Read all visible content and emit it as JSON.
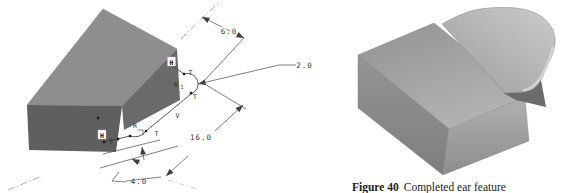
{
  "left_view": {
    "dims": {
      "width": "6.0",
      "radius": "2.0",
      "length": "16.0",
      "offset": "4.0"
    },
    "labels": {
      "h_upper": "H",
      "t_upper_1": "T",
      "r1_main": "R",
      "r1_sub": "1",
      "t_upper_2": "T",
      "v": "V",
      "h_lower": "H",
      "t_lower_1": "T",
      "r_lower": "R",
      "t_lower_2": "T"
    }
  },
  "caption": {
    "label": "Figure 40",
    "text": "Completed ear feature"
  },
  "colors": {
    "block_top": "#8e8e8e",
    "block_left": "#5f5f5f",
    "block_right": "#6a6a6a",
    "rtop_a": "#929292",
    "rtop_b": "#b3b3b3",
    "rleft_a": "#949494",
    "rleft_b": "#7e7e7e",
    "rright_a": "#b0b0b0",
    "rright_b": "#8d8d8d",
    "tab_a": "#9c9c9c",
    "tab_b": "#cbcbcb",
    "tab_edge": "#d6d6d6",
    "shadow": "#6b6b6b",
    "line": "#4a4a4a"
  }
}
